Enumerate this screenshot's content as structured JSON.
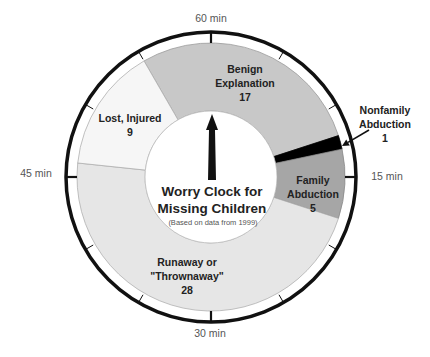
{
  "chart_data": {
    "type": "pie",
    "variant": "donut-clock",
    "title": "Worry Clock for",
    "title_line2": "Missing Children",
    "subtitle": "(Based on data from 1999)",
    "total_minutes": 60,
    "start_minute": 55,
    "categories": [
      "Benign Explanation",
      "Nonfamily Abduction",
      "Family Abduction",
      "Runaway or \"Thrownaway\"",
      "Lost, Injured"
    ],
    "values": [
      17,
      1,
      5,
      28,
      9
    ],
    "segments": [
      {
        "name": "benign-explanation",
        "label_lines": [
          "Benign",
          "Explanation",
          "17"
        ],
        "value": 17,
        "color": "#c8c8c8",
        "label_pos": [
          245,
          73
        ],
        "stroke": "#9a9a9a"
      },
      {
        "name": "nonfamily-abduction",
        "label_lines": [
          "Nonfamily",
          "Abduction",
          "1"
        ],
        "value": 1,
        "color": "#000000",
        "label_pos": [
          385,
          114
        ],
        "stroke": "#000000"
      },
      {
        "name": "family-abduction",
        "label_lines": [
          "Family",
          "Abduction",
          "5"
        ],
        "value": 5,
        "color": "#a6a6a6",
        "label_pos": [
          313,
          184
        ],
        "stroke": "#8a8a8a"
      },
      {
        "name": "runaway-thrownaway",
        "label_lines": [
          "Runaway or",
          "\"Thrownaway\"",
          "28"
        ],
        "value": 28,
        "color": "#e6e6e6",
        "label_pos": [
          187,
          266
        ],
        "stroke": "#b0b0b0"
      },
      {
        "name": "lost-injured",
        "label_lines": [
          "Lost, Injured",
          "9"
        ],
        "value": 9,
        "color": "#f6f6f6",
        "label_pos": [
          130,
          122
        ],
        "stroke": "#b0b0b0"
      }
    ],
    "clock_labels": [
      {
        "text": "60 min",
        "x": 211,
        "y": 22
      },
      {
        "text": "15 min",
        "x": 387,
        "y": 180
      },
      {
        "text": "30 min",
        "x": 210,
        "y": 337
      },
      {
        "text": "45 min",
        "x": 36,
        "y": 177
      }
    ],
    "geometry": {
      "cx": 211,
      "cy": 177,
      "ring_r": 145,
      "outer_r": 134,
      "inner_r": 66
    },
    "arrow": {
      "from": [
        369,
        130
      ],
      "to": [
        342,
        146
      ]
    },
    "colors": {
      "ring": "#111111",
      "hand": "#111111",
      "text": "#222222"
    }
  }
}
